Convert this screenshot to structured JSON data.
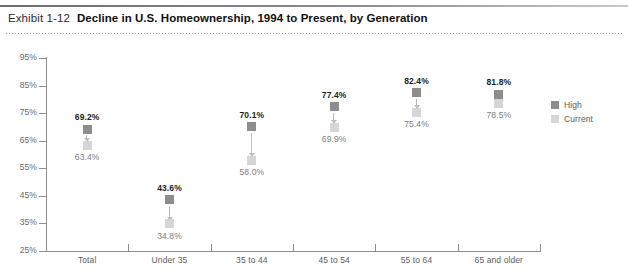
{
  "header": {
    "exhibit_number": "Exhibit 1-12",
    "title": "Decline in U.S. Homeownership, 1994 to Present, by Generation"
  },
  "legend": {
    "position": "right",
    "items": [
      {
        "label": "High",
        "color": "#8d8d8d",
        "name": "legend-item-high"
      },
      {
        "label": "Current",
        "color": "#d6d6d6",
        "name": "legend-item-current"
      }
    ]
  },
  "chart_data": {
    "type": "scatter",
    "title": "Decline in U.S. Homeownership, 1994 to Present, by Generation",
    "xlabel": "",
    "ylabel": "",
    "ylim": [
      25,
      95
    ],
    "ytick_labels": [
      "95%",
      "85%",
      "75%",
      "65%",
      "55%",
      "45%",
      "35%",
      "25%"
    ],
    "yticks": [
      95,
      85,
      75,
      65,
      55,
      45,
      35,
      25
    ],
    "grid": false,
    "categories": [
      "Total",
      "Under 35",
      "35 to 44",
      "45 to 54",
      "55 to 64",
      "65 and older"
    ],
    "series": [
      {
        "name": "High",
        "color": "#8d8d8d",
        "values": [
          69.2,
          43.6,
          70.1,
          77.4,
          82.4,
          81.8
        ],
        "labels": [
          "69.2%",
          "43.6%",
          "70.1%",
          "77.4%",
          "82.4%",
          "81.8%"
        ]
      },
      {
        "name": "Current",
        "color": "#d6d6d6",
        "values": [
          63.4,
          34.8,
          58.0,
          69.9,
          75.4,
          78.5
        ],
        "labels": [
          "63.4%",
          "34.8%",
          "58.0%",
          "69.9%",
          "75.4%",
          "78.5%"
        ]
      }
    ]
  }
}
